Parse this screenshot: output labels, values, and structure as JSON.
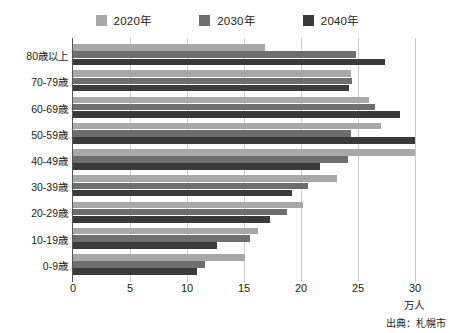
{
  "chart_data": {
    "type": "bar",
    "orientation": "horizontal",
    "title": "",
    "xlabel": "万人",
    "ylabel": "",
    "xlim": [
      0,
      30
    ],
    "xticks": [
      0,
      5,
      10,
      15,
      20,
      25,
      30
    ],
    "grid": true,
    "legend_position": "top-center",
    "categories": [
      "80歳以上",
      "70-79歳",
      "60-69歳",
      "50-59歳",
      "40-49歳",
      "30-39歳",
      "20-29歳",
      "10-19歳",
      "0-9歳"
    ],
    "series": [
      {
        "name": "2020年",
        "color": "#a8a8a8",
        "values": [
          16.8,
          24.4,
          26.0,
          27.0,
          30.0,
          23.2,
          20.2,
          16.2,
          15.1
        ]
      },
      {
        "name": "2030年",
        "color": "#6e6e6e",
        "values": [
          24.8,
          24.5,
          26.5,
          24.4,
          24.1,
          20.6,
          18.8,
          15.5,
          11.6
        ]
      },
      {
        "name": "2040年",
        "color": "#3a3a3a",
        "values": [
          27.4,
          24.2,
          28.7,
          30.0,
          21.7,
          19.2,
          17.3,
          12.6,
          10.9
        ]
      }
    ],
    "source_note": "出典：札幌市"
  },
  "axis": {
    "unit_label": "万人"
  }
}
